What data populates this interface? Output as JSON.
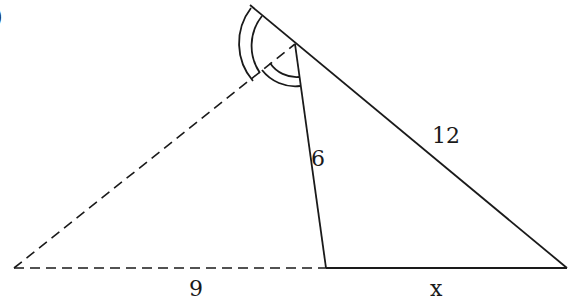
{
  "diagram": {
    "type": "triangle-angle-bisector",
    "corner_mark": ")",
    "labels": {
      "side_long": "12",
      "side_mid": "6",
      "base_left": "9",
      "base_right": "x"
    },
    "points": {
      "top_ext": [
        250,
        5
      ],
      "A": [
        295,
        44
      ],
      "B": [
        567,
        268
      ],
      "C": [
        326,
        268
      ],
      "D": [
        14,
        268
      ]
    },
    "colors": {
      "stroke": "#1a1a1a",
      "background": "#ffffff"
    }
  }
}
